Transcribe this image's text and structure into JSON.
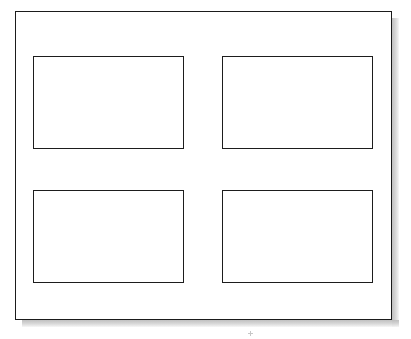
{
  "figure": {
    "kind": "blank-layout-diagram",
    "background_color": "#ffffff",
    "frame": {
      "label": "outer frame",
      "border_color": "#1b1b1b",
      "fill_color": "#ffffff",
      "border_width_px": 2,
      "x": 15,
      "y": 11,
      "width": 377,
      "height": 309
    },
    "shadow": {
      "label": "drop shadow",
      "color": "#c8c8c8",
      "sides": [
        "right",
        "bottom"
      ],
      "offset_px": 7,
      "thickness_px": 7
    },
    "grid": {
      "rows": 2,
      "columns": 2,
      "panel_count": 4,
      "panel_width": 151,
      "panel_height": 93,
      "column_gap": 38,
      "row_gap": 41
    },
    "panels": [
      {
        "name": "panel-top-left",
        "row": 1,
        "column": 1,
        "content": "",
        "border_color": "#1d1d1d",
        "fill_color": "#ffffff"
      },
      {
        "name": "panel-top-right",
        "row": 1,
        "column": 2,
        "content": "",
        "border_color": "#1d1d1d",
        "fill_color": "#ffffff"
      },
      {
        "name": "panel-bottom-left",
        "row": 2,
        "column": 1,
        "content": "",
        "border_color": "#1d1d1d",
        "fill_color": "#ffffff"
      },
      {
        "name": "panel-bottom-right",
        "row": 2,
        "column": 2,
        "content": "",
        "border_color": "#1d1d1d",
        "fill_color": "#ffffff"
      }
    ],
    "marks": [
      {
        "name": "registration-mark",
        "glyph": "+",
        "color": "#9a9a9a",
        "x": 248,
        "y": 331
      }
    ]
  }
}
